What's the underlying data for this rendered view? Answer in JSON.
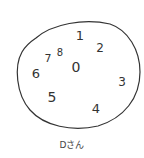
{
  "drawing": {
    "type": "hand-drawn clock",
    "stroke_color": "#333333",
    "center_label": "0",
    "numbers": [
      {
        "label": "1",
        "x": 80,
        "y": 40,
        "size": 13
      },
      {
        "label": "2",
        "x": 100,
        "y": 52,
        "size": 12
      },
      {
        "label": "3",
        "x": 122,
        "y": 86,
        "size": 12
      },
      {
        "label": "4",
        "x": 96,
        "y": 113,
        "size": 13
      },
      {
        "label": "5",
        "x": 52,
        "y": 102,
        "size": 14
      },
      {
        "label": "6",
        "x": 36,
        "y": 78,
        "size": 13
      },
      {
        "label": "7",
        "x": 48,
        "y": 62,
        "size": 11
      },
      {
        "label": "8",
        "x": 60,
        "y": 56,
        "size": 10
      }
    ]
  },
  "caption": "Dさん"
}
